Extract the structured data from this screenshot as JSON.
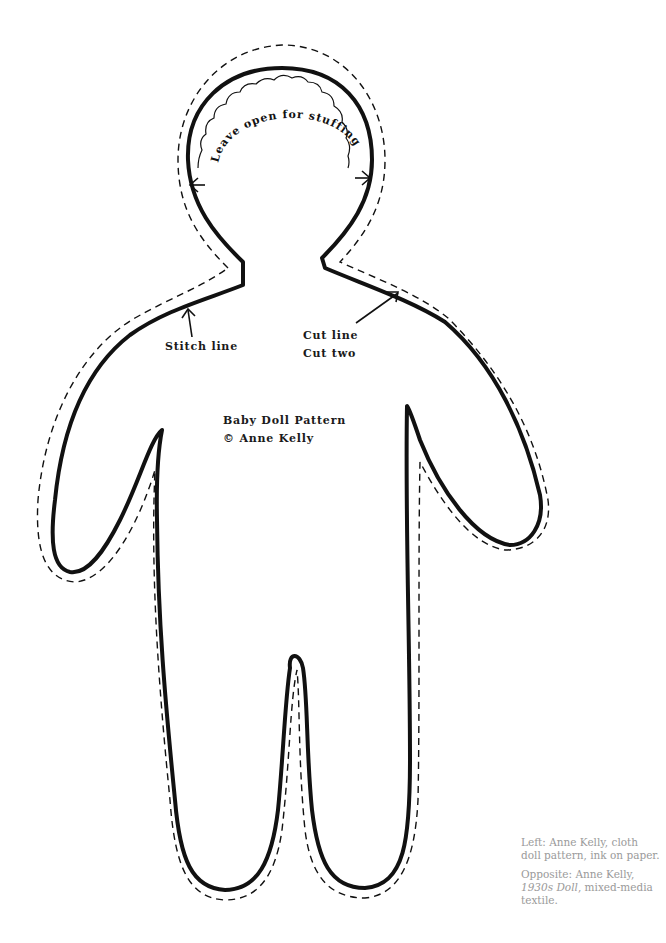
{
  "pattern": {
    "title": "Baby Doll Pattern",
    "copyright": "© Anne Kelly",
    "stuffing_label": "Leave open for stuffing",
    "stitch_label": "Stitch line",
    "cut_label_line1": "Cut line",
    "cut_label_line2": "Cut two",
    "colors": {
      "ink": "#111111",
      "background": "#ffffff",
      "caption": "#9a9a9a"
    }
  },
  "caption": {
    "left": "Left: Anne Kelly, cloth doll pattern, ink on paper.",
    "opposite_prefix": "Opposite: Anne Kelly, ",
    "opposite_title": "1930s Doll",
    "opposite_suffix": ", mixed-media textile."
  }
}
